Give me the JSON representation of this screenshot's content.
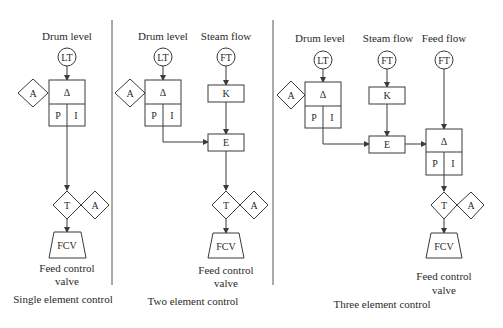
{
  "colors": {
    "line": "#3a3a3a",
    "text": "#2a2a2a",
    "background": "#ffffff"
  },
  "panels": [
    {
      "caption": "Single element control",
      "inputs": [
        {
          "label": "Drum level",
          "transmitter": "LT"
        }
      ],
      "controller": {
        "top": "Δ",
        "left": "P",
        "right": "I",
        "auto_manual": "A"
      },
      "transfer": {
        "label": "T",
        "auto_manual": "A"
      },
      "valve": {
        "label": "FCV",
        "caption_line1": "Feed control",
        "caption_line2": "valve"
      }
    },
    {
      "caption": "Two element control",
      "inputs": [
        {
          "label": "Drum level",
          "transmitter": "LT"
        },
        {
          "label": "Steam flow",
          "transmitter": "FT"
        }
      ],
      "controller": {
        "top": "Δ",
        "left": "P",
        "right": "I",
        "auto_manual": "A"
      },
      "gain": "K",
      "summer": "E",
      "transfer": {
        "label": "T",
        "auto_manual": "A"
      },
      "valve": {
        "label": "FCV",
        "caption_line1": "Feed control",
        "caption_line2": "valve"
      }
    },
    {
      "caption": "Three element control",
      "inputs": [
        {
          "label": "Drum level",
          "transmitter": "LT"
        },
        {
          "label": "Steam flow",
          "transmitter": "FT"
        },
        {
          "label": "Feed flow",
          "transmitter": "FT"
        }
      ],
      "controller": {
        "top": "Δ",
        "left": "P",
        "right": "I",
        "auto_manual": "A"
      },
      "gain": "K",
      "summer": "E",
      "flow_controller": {
        "top": "Δ",
        "left": "P",
        "right": "I"
      },
      "transfer": {
        "label": "T",
        "auto_manual": "A"
      },
      "valve": {
        "label": "FCV",
        "caption_line1": "Feed control",
        "caption_line2": "valve"
      }
    }
  ]
}
